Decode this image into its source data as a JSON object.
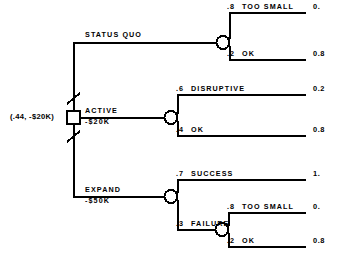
{
  "diagram": {
    "type": "decision-tree",
    "root": {
      "label": "(.44, -$20K)",
      "node_kind": "decision-square"
    },
    "branches": [
      {
        "id": "status-quo",
        "label": "STATUS QUO",
        "cost": "",
        "pruned": true,
        "outcomes": [
          {
            "prob": ".8",
            "name": "TOO SMALL",
            "payoff": "0."
          },
          {
            "prob": ".2",
            "name": "OK",
            "payoff": "0.8"
          }
        ]
      },
      {
        "id": "active",
        "label": "ACTIVE",
        "cost": "-$20K",
        "pruned": false,
        "outcomes": [
          {
            "prob": ".6",
            "name": "DISRUPTIVE",
            "payoff": "0.2"
          },
          {
            "prob": ".4",
            "name": "OK",
            "payoff": "0.8"
          }
        ]
      },
      {
        "id": "expand",
        "label": "EXPAND",
        "cost": "-$50K",
        "pruned": true,
        "outcomes": [
          {
            "prob": ".7",
            "name": "SUCCESS",
            "payoff": "1."
          },
          {
            "prob": ".3",
            "name": "FAILURE",
            "payoff": "",
            "sub_outcomes": [
              {
                "prob": ".8",
                "name": "TOO SMALL",
                "payoff": "0."
              },
              {
                "prob": ".2",
                "name": "OK",
                "payoff": "0.8"
              }
            ]
          }
        ]
      }
    ],
    "colors": {
      "line": "#000000",
      "background": "#ffffff"
    }
  }
}
